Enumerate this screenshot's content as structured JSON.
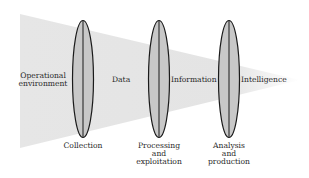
{
  "diagram": {
    "funnel": {
      "color": "#e2e2e2"
    },
    "lens": {
      "fill": "#c8c8c8",
      "stroke": "#1a1a1a"
    },
    "flow_labels": [
      {
        "id": "operational-environment",
        "lines": [
          "Operational",
          "environment"
        ]
      },
      {
        "id": "data",
        "text": "Data"
      },
      {
        "id": "information",
        "text": "Information"
      },
      {
        "id": "intelligence",
        "text": "Intelligence"
      }
    ],
    "stages": [
      {
        "id": "collection",
        "lines": [
          "Collection"
        ]
      },
      {
        "id": "processing-exploitation",
        "lines": [
          "Processing",
          "and",
          "exploitation"
        ]
      },
      {
        "id": "analysis-production",
        "lines": [
          "Analysis",
          "and",
          "production"
        ]
      }
    ]
  }
}
